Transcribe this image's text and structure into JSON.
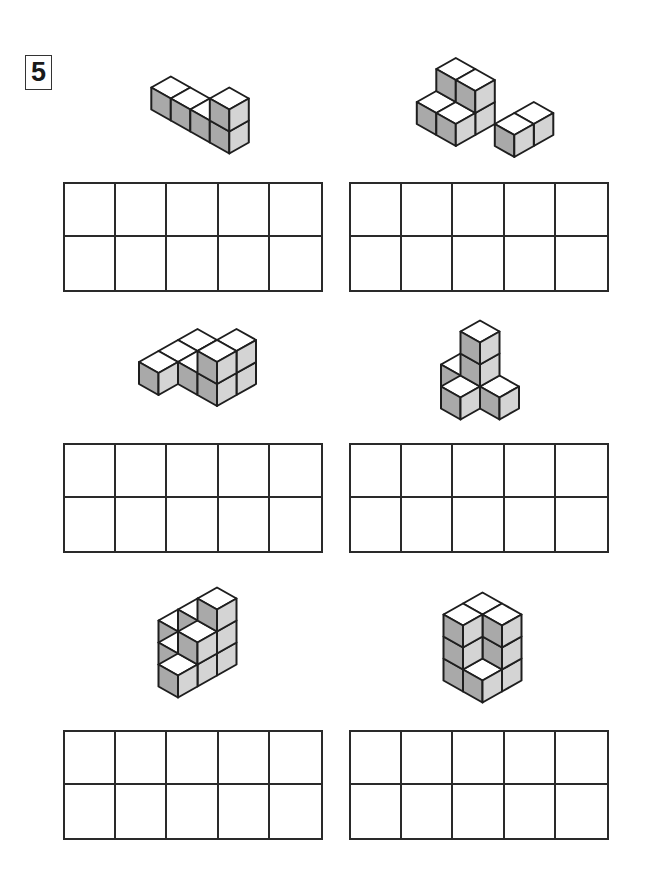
{
  "problem_number": "5",
  "colors": {
    "top_face": "#ffffff",
    "left_face": "#a9a9a9",
    "right_face": "#d4d4d4",
    "outline": "#1e1e1e"
  },
  "answer_grid": {
    "rows": 2,
    "cols": 5
  },
  "figures": [
    {
      "name": "figure-1",
      "cubes": [
        [
          0,
          0,
          0
        ],
        [
          1,
          0,
          0
        ],
        [
          2,
          0,
          0
        ],
        [
          3,
          0,
          0
        ],
        [
          3,
          0,
          1
        ]
      ]
    },
    {
      "name": "figure-2",
      "cubes": [
        [
          0,
          1,
          0
        ],
        [
          1,
          1,
          0
        ],
        [
          0,
          1,
          1
        ],
        [
          1,
          1,
          1
        ],
        [
          0,
          0,
          0
        ],
        [
          1,
          0,
          0
        ],
        [
          3,
          1,
          0
        ],
        [
          3,
          2,
          0
        ]
      ]
    },
    {
      "name": "figure-3",
      "cubes": [
        [
          0,
          0,
          0
        ],
        [
          0,
          1,
          0
        ],
        [
          1,
          1,
          0
        ],
        [
          2,
          1,
          0
        ],
        [
          0,
          2,
          0
        ],
        [
          2,
          1,
          1
        ],
        [
          2,
          2,
          0
        ],
        [
          2,
          2,
          1
        ]
      ]
    },
    {
      "name": "figure-4",
      "cubes": [
        [
          0,
          1,
          0
        ],
        [
          1,
          1,
          0
        ],
        [
          1,
          1,
          1
        ],
        [
          1,
          1,
          2
        ],
        [
          1,
          0,
          0
        ],
        [
          2,
          1,
          0
        ]
      ]
    },
    {
      "name": "figure-5",
      "cubes": [
        [
          0,
          2,
          0
        ],
        [
          1,
          1,
          0
        ],
        [
          2,
          0,
          0
        ],
        [
          1,
          2,
          0
        ],
        [
          2,
          1,
          0
        ],
        [
          2,
          2,
          0
        ],
        [
          1,
          2,
          1
        ],
        [
          2,
          1,
          1
        ],
        [
          2,
          2,
          1
        ],
        [
          2,
          2,
          2
        ]
      ]
    },
    {
      "name": "figure-6",
      "cubes": [
        [
          0,
          1,
          0
        ],
        [
          0,
          1,
          1
        ],
        [
          0,
          1,
          2
        ],
        [
          0,
          2,
          0
        ],
        [
          0,
          2,
          1
        ],
        [
          0,
          2,
          2
        ],
        [
          1,
          2,
          0
        ],
        [
          1,
          2,
          1
        ],
        [
          1,
          2,
          2
        ],
        [
          1,
          1,
          0
        ]
      ]
    }
  ]
}
